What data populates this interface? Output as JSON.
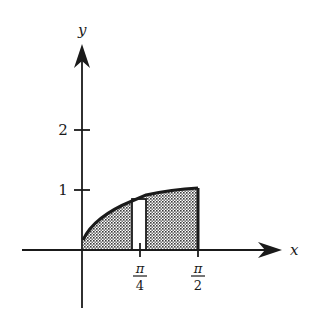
{
  "diagram": {
    "type": "area-under-curve",
    "axes": {
      "x_label": "x",
      "y_label": "y"
    },
    "y_ticks": [
      {
        "value": 1,
        "label": "1"
      },
      {
        "value": 2,
        "label": "2"
      }
    ],
    "x_ticks": [
      {
        "value": "pi/4",
        "numerator": "π",
        "denominator": "4"
      },
      {
        "value": "pi/2",
        "numerator": "π",
        "denominator": "2"
      }
    ],
    "colors": {
      "ink": "#1a1a1a",
      "shade": "#9a9a9a",
      "background": "#ffffff"
    }
  }
}
